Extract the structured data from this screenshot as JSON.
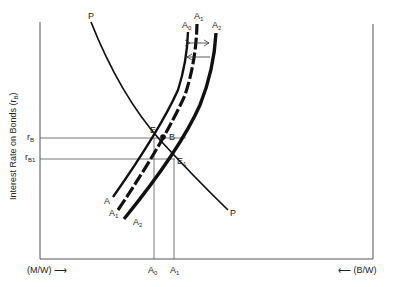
{
  "diagram": {
    "y_axis_label": "Interest Rate on Bonds (r",
    "y_axis_label_sub": "B",
    "y_axis_label_close": ")",
    "x_axis_left_label": "(M/W) ⟶",
    "x_axis_right_label": "⟵ (B/W)",
    "ticks_y": [
      {
        "label": "r",
        "sub": "B"
      },
      {
        "label": "r",
        "sub": "B1"
      }
    ],
    "ticks_x": [
      {
        "label": "A",
        "sub": "0"
      },
      {
        "label": "A",
        "sub": "1"
      }
    ],
    "curves": {
      "P_top": "P",
      "P_bottom": "P",
      "A0_top": {
        "label": "A",
        "sub": "0"
      },
      "A1_top": {
        "label": "A",
        "sub": "1"
      },
      "A2_top": {
        "label": "A",
        "sub": "2"
      },
      "A_bottom": "A",
      "A1_bottom": {
        "label": "A",
        "sub": "1"
      },
      "A2_bottom": {
        "label": "A",
        "sub": "2"
      }
    },
    "points": {
      "E": "E",
      "B": "B",
      "E1": {
        "label": "E",
        "sub": "1"
      }
    },
    "colors": {
      "ink": "#111111",
      "axis": "#555555",
      "guide": "#666666"
    }
  }
}
